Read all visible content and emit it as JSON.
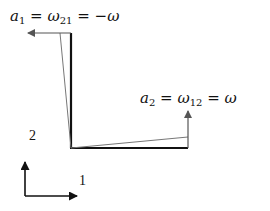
{
  "diagram": {
    "labels": {
      "a1": {
        "var": "a",
        "sub": "1",
        "eq1": "=",
        "omega": "ω",
        "omega_sub": "21",
        "eq2": "=",
        "rhs": "−ω"
      },
      "a2": {
        "var": "a",
        "sub": "2",
        "eq1": "=",
        "omega": "ω",
        "omega_sub": "12",
        "eq2": "=",
        "rhs": "ω"
      }
    },
    "axes": {
      "x_label": "1",
      "y_label": "2"
    },
    "colors": {
      "element": "#111111",
      "deformed": "#777777",
      "arrow": "#555555"
    }
  }
}
